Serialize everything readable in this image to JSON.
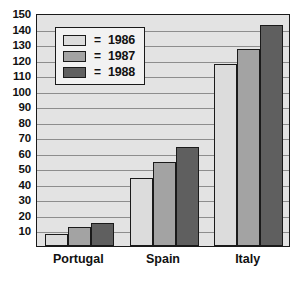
{
  "chart_data": {
    "type": "bar",
    "title": "",
    "xlabel": "",
    "ylabel": "",
    "categories": [
      "Portugal",
      "Spain",
      "Italy"
    ],
    "series": [
      {
        "name": "1986",
        "color": "#dcdcdc",
        "values": [
          8,
          44,
          117
        ]
      },
      {
        "name": "1987",
        "color": "#a3a3a3",
        "values": [
          12,
          54,
          127
        ]
      },
      {
        "name": "1988",
        "color": "#5f5f5f",
        "values": [
          15,
          64,
          142
        ]
      }
    ],
    "ylim": [
      0,
      150
    ],
    "y_ticks": [
      10,
      20,
      30,
      40,
      50,
      60,
      70,
      80,
      90,
      100,
      110,
      120,
      130,
      140,
      150
    ],
    "y_tick_labels": [
      "10",
      "20",
      "30",
      "40",
      "50",
      "60",
      "70",
      "80",
      "90",
      "100",
      "110",
      "120",
      "130",
      "140",
      "150"
    ],
    "grid": true,
    "legend_position": "top-left",
    "legend_separator": "=",
    "plot_background": "#e3e3e3",
    "grid_color": "#8d8d8d",
    "axis_color": "#1a1a1a"
  }
}
